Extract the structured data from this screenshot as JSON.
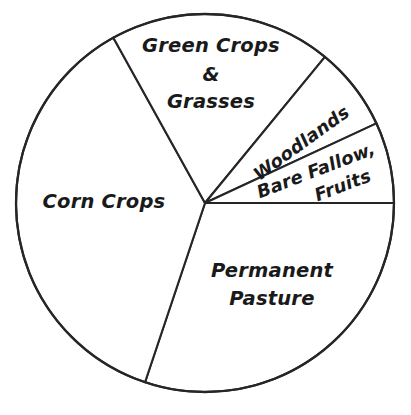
{
  "figure": {
    "title": "",
    "background_color": "#ffffff",
    "line_color": "#262626",
    "text_color": "#1a1a1a"
  },
  "labels": {
    "green_crops_line1": "Green Crops",
    "green_crops_line2": "&",
    "green_crops_line3": "Grasses",
    "woodlands": "Woodlands",
    "bare_fallow_line1": "Bare Fallow,",
    "bare_fallow_line2": "Fruits",
    "corn_crops": "Corn Crops",
    "permanent_pasture_line1": "Permanent",
    "permanent_pasture_line2": "Pasture"
  },
  "chart_data": {
    "type": "pie",
    "title": "",
    "subtitle": "",
    "xlabel": "",
    "ylabel": "",
    "grid": false,
    "legend_position": "none",
    "labels_inside_slices": true,
    "center_px": [
      205,
      203
    ],
    "radius_px": 189,
    "start_angle_deg": 0,
    "direction": "counterclockwise",
    "categories": [
      "Bare Fallow, Fruits",
      "Woodlands",
      "Green Crops & Grasses",
      "Corn Crops",
      "Permanent Pasture"
    ],
    "values": [
      6.9,
      7.1,
      19.0,
      36.8,
      30.2
    ],
    "angles_deg": [
      24.9,
      25.7,
      68.4,
      132.5,
      108.5
    ],
    "slices": [
      {
        "label": "Bare Fallow, Fruits",
        "value": 6.9,
        "angle_deg": 24.9,
        "start_angle_deg": 0.0,
        "end_angle_deg": 24.9,
        "fill": "#ffffff"
      },
      {
        "label": "Woodlands",
        "value": 7.1,
        "angle_deg": 25.7,
        "start_angle_deg": 24.9,
        "end_angle_deg": 50.6,
        "fill": "#ffffff"
      },
      {
        "label": "Green Crops & Grasses",
        "value": 19.0,
        "angle_deg": 68.4,
        "start_angle_deg": 50.6,
        "end_angle_deg": 119.0,
        "fill": "#ffffff"
      },
      {
        "label": "Corn Crops",
        "value": 36.8,
        "angle_deg": 132.5,
        "start_angle_deg": 119.0,
        "end_angle_deg": 251.5,
        "fill": "#ffffff"
      },
      {
        "label": "Permanent Pasture",
        "value": 30.2,
        "angle_deg": 108.5,
        "start_angle_deg": 251.5,
        "end_angle_deg": 360.0,
        "fill": "#ffffff"
      }
    ]
  }
}
